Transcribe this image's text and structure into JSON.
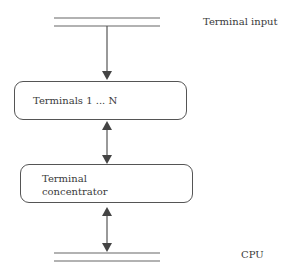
{
  "diagram": {
    "bus_top_label": "Terminal input",
    "bus_bottom_label": "CPU",
    "boxes": [
      {
        "id": "terminals",
        "lines": [
          "Terminals 1 ... N"
        ]
      },
      {
        "id": "concentrator",
        "lines": [
          "Terminal",
          "concentrator"
        ]
      }
    ],
    "connections": [
      {
        "from": "terminal-input-bus",
        "to": "terminals",
        "direction": "one-way-down"
      },
      {
        "from": "terminals",
        "to": "concentrator",
        "direction": "two-way"
      },
      {
        "from": "concentrator",
        "to": "cpu-bus",
        "direction": "two-way"
      }
    ],
    "colors": {
      "line": "#555555",
      "text": "#3a3a3a",
      "background": "#ffffff"
    }
  }
}
